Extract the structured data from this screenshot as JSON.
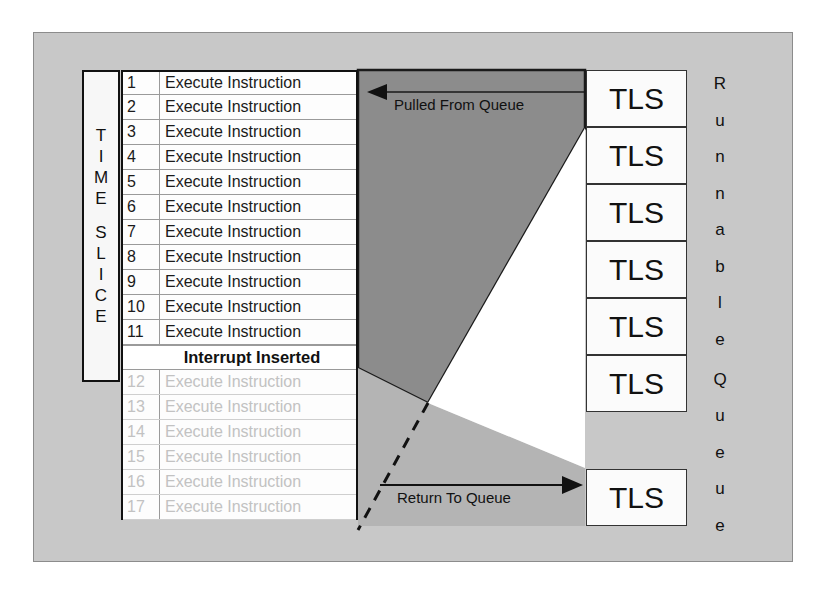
{
  "diagram": {
    "panel_color": "#c8c8c8",
    "dark_region_color": "#8c8c8c",
    "mid_region_color": "#b4b4b4",
    "white_region_color": "#ffffff"
  },
  "time_slice_label": {
    "name": "TIME SLICE",
    "line1": [
      "T",
      "I",
      "M",
      "E"
    ],
    "line2": [
      "S",
      "L",
      "I",
      "C",
      "E"
    ]
  },
  "instruction_table": {
    "rows": [
      {
        "num": "1",
        "label": "Execute Instruction",
        "state": "active"
      },
      {
        "num": "2",
        "label": "Execute Instruction",
        "state": "active"
      },
      {
        "num": "3",
        "label": "Execute Instruction",
        "state": "active"
      },
      {
        "num": "4",
        "label": "Execute Instruction",
        "state": "active"
      },
      {
        "num": "5",
        "label": "Execute Instruction",
        "state": "active"
      },
      {
        "num": "6",
        "label": "Execute Instruction",
        "state": "active"
      },
      {
        "num": "7",
        "label": "Execute Instruction",
        "state": "active"
      },
      {
        "num": "8",
        "label": "Execute Instruction",
        "state": "active"
      },
      {
        "num": "9",
        "label": "Execute Instruction",
        "state": "active"
      },
      {
        "num": "10",
        "label": "Execute Instruction",
        "state": "active"
      },
      {
        "num": "11",
        "label": "Execute Instruction",
        "state": "active"
      },
      {
        "num": "",
        "label": "Interrupt Inserted",
        "state": "interrupt"
      },
      {
        "num": "12",
        "label": "Execute Instruction",
        "state": "dimmed"
      },
      {
        "num": "13",
        "label": "Execute Instruction",
        "state": "dimmed"
      },
      {
        "num": "14",
        "label": "Execute Instruction",
        "state": "dimmed"
      },
      {
        "num": "15",
        "label": "Execute Instruction",
        "state": "dimmed"
      },
      {
        "num": "16",
        "label": "Execute Instruction",
        "state": "dimmed"
      },
      {
        "num": "17",
        "label": "Execute Instruction",
        "state": "dimmed"
      }
    ]
  },
  "queue": {
    "blocks": [
      {
        "label": "TLS"
      },
      {
        "label": "TLS"
      },
      {
        "label": "TLS"
      },
      {
        "label": "TLS"
      },
      {
        "label": "TLS"
      },
      {
        "label": "TLS"
      }
    ],
    "returning_block": {
      "label": "TLS"
    },
    "vertical_label": {
      "text": "Runnable Queue",
      "word1": [
        "R",
        "u",
        "n",
        "n",
        "a",
        "b",
        "l",
        "e"
      ],
      "word2": [
        "Q",
        "u",
        "e",
        "u",
        "e"
      ]
    }
  },
  "arrows": {
    "pulled_from_queue": "Pulled From Queue",
    "return_to_queue": "Return To Queue"
  }
}
